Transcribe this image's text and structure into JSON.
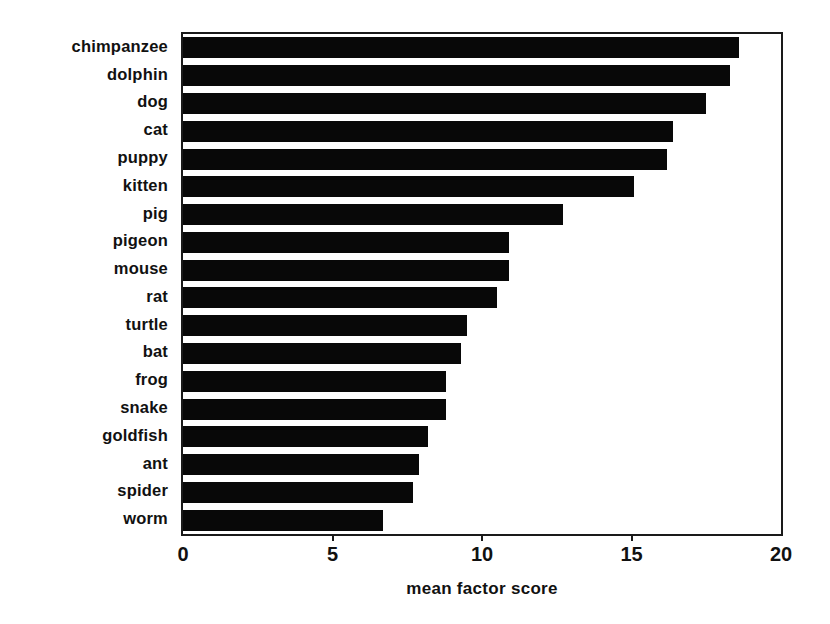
{
  "chart_data": {
    "type": "bar",
    "orientation": "horizontal",
    "title": "",
    "xlabel": "mean factor score",
    "ylabel": "",
    "xlim": [
      0,
      20
    ],
    "xticks": [
      0,
      5,
      10,
      15,
      20
    ],
    "xtick_labels": [
      "0",
      "5",
      "10",
      "15",
      "20"
    ],
    "grid": false,
    "legend": false,
    "bar_color": "#080808",
    "categories": [
      "chimpanzee",
      "dolphin",
      "dog",
      "cat",
      "puppy",
      "kitten",
      "pig",
      "pigeon",
      "mouse",
      "rat",
      "turtle",
      "bat",
      "frog",
      "snake",
      "goldfish",
      "ant",
      "spider",
      "worm"
    ],
    "values": [
      18.6,
      18.3,
      17.5,
      16.4,
      16.2,
      15.1,
      12.7,
      10.9,
      10.9,
      10.5,
      9.5,
      9.3,
      8.8,
      8.8,
      8.2,
      7.9,
      7.7,
      6.7
    ]
  }
}
